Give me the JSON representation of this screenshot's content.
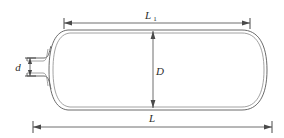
{
  "figure": {
    "type": "engineering-dimension-drawing",
    "background_color": "#ffffff",
    "line_color": "#6b6b6b",
    "dimension_color": "#4a4a4a",
    "text_color": "#2b2b2b"
  },
  "dimensions": {
    "overall_length": {
      "symbol": "L",
      "subscript": "",
      "position": "bottom",
      "label_x": 152,
      "label_y": 118,
      "line_y": 127,
      "start_x": 33,
      "end_x": 272
    },
    "cylinder_length": {
      "symbol": "L",
      "subscript": "1",
      "position": "top",
      "label_x": 152,
      "label_y": 15,
      "line_y": 23,
      "start_x": 64,
      "end_x": 250
    },
    "vessel_diameter": {
      "symbol": "D",
      "subscript": "",
      "position": "center-vertical",
      "label_x": 157,
      "label_y": 71,
      "line_x": 153,
      "start_y": 31,
      "end_y": 108
    },
    "nozzle_diameter": {
      "symbol": "d",
      "subscript": "",
      "position": "left-vertical",
      "label_x": 15,
      "label_y": 71,
      "line_x": 30,
      "start_y": 58,
      "end_y": 76
    }
  },
  "geometry": {
    "vessel_body_left": 48,
    "vessel_body_right": 268,
    "vessel_top": 29,
    "vessel_bottom": 110,
    "wall_thickness_px": 3,
    "nozzle_left": 26,
    "nozzle_right": 50,
    "nozzle_top": 58,
    "nozzle_bottom": 76
  }
}
